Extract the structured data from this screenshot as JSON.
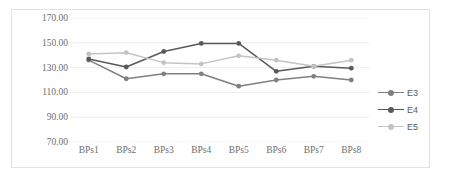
{
  "chart_data": {
    "type": "line",
    "title": "",
    "xlabel": "",
    "ylabel": "",
    "categories": [
      "BPs1",
      "BPs2",
      "BPs3",
      "BPs4",
      "BPs5",
      "BPs6",
      "BPs7",
      "BPs8"
    ],
    "ylim": [
      70,
      170
    ],
    "ytick_labels": [
      "170.00",
      "150.00",
      "130.00",
      "110.00",
      "90.00",
      "70.00"
    ],
    "yticks": [
      170,
      150,
      130,
      110,
      90,
      70
    ],
    "grid": true,
    "grid_axis": "y",
    "legend_position": "right",
    "series": [
      {
        "name": "E3",
        "color": "#808080",
        "values": [
          136.0,
          121.0,
          125.0,
          125.0,
          115.0,
          120.0,
          123.0,
          120.0
        ]
      },
      {
        "name": "E4",
        "color": "#595959",
        "values": [
          137.0,
          130.5,
          143.0,
          149.5,
          149.5,
          127.0,
          131.0,
          129.5
        ]
      },
      {
        "name": "E5",
        "color": "#c4c4c4",
        "values": [
          141.0,
          142.0,
          134.0,
          133.0,
          139.5,
          136.0,
          131.0,
          136.0
        ]
      }
    ]
  },
  "legend": {
    "items": [
      {
        "label": "E3"
      },
      {
        "label": "E4"
      },
      {
        "label": "E5"
      }
    ]
  },
  "colors": {
    "grid": "#efefef",
    "frame": "#e2e2e2",
    "tick_text": "#6e6e6e",
    "legend_text": "#5a5a5a",
    "background": "#ffffff"
  }
}
